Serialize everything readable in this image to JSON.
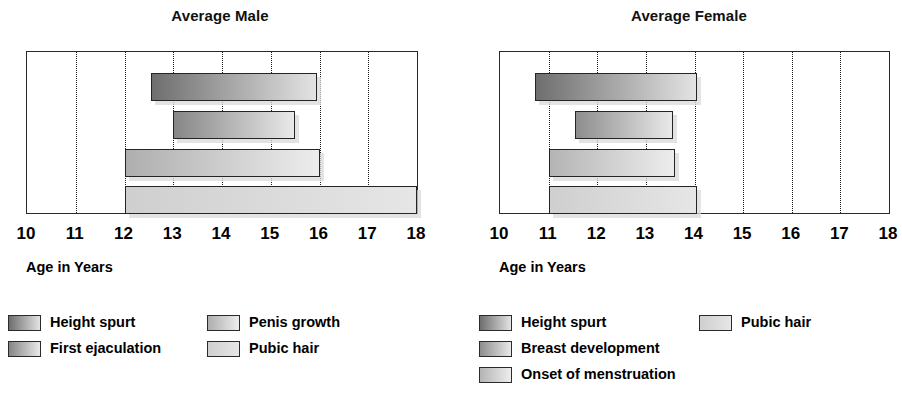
{
  "chart_data": [
    {
      "type": "bar",
      "orientation": "horizontal",
      "title": "Average Male",
      "xlabel": "Age in Years",
      "ylabel": "",
      "xlim": [
        10,
        18
      ],
      "xticks": [
        "10",
        "11",
        "12",
        "13",
        "14",
        "15",
        "16",
        "17",
        "18"
      ],
      "grid": true,
      "legend_position": "bottom",
      "bars": [
        {
          "label": "Height spurt",
          "start": 12.55,
          "end": 15.95,
          "fill_dark": "#6e6e6e",
          "fill_light": "#e3e3e3"
        },
        {
          "label": "First ejaculation",
          "start": 13.0,
          "end": 15.5,
          "fill_dark": "#868686",
          "fill_light": "#e9e9e9"
        },
        {
          "label": "Penis growth",
          "start": 12.0,
          "end": 16.0,
          "fill_dark": "#aeaeae",
          "fill_light": "#ededed"
        },
        {
          "label": "Pubic hair",
          "start": 12.0,
          "end": 18.0,
          "fill_dark": "#cfcfcf",
          "fill_light": "#e6e6e6"
        }
      ],
      "legend": [
        {
          "label": "Height spurt",
          "fill_dark": "#6e6e6e",
          "fill_light": "#e3e3e3"
        },
        {
          "label": "Penis growth",
          "fill_dark": "#aeaeae",
          "fill_light": "#ededed"
        },
        {
          "label": "First ejaculation",
          "fill_dark": "#868686",
          "fill_light": "#e9e9e9"
        },
        {
          "label": "Pubic hair",
          "fill_dark": "#cfcfcf",
          "fill_light": "#e6e6e6"
        }
      ]
    },
    {
      "type": "bar",
      "orientation": "horizontal",
      "title": "Average Female",
      "xlabel": "Age in Years",
      "ylabel": "",
      "xlim": [
        10,
        18
      ],
      "xticks": [
        "10",
        "11",
        "12",
        "13",
        "14",
        "15",
        "16",
        "17",
        "18"
      ],
      "grid": true,
      "legend_position": "bottom",
      "bars": [
        {
          "label": "Height spurt",
          "start": 10.72,
          "end": 14.06,
          "fill_dark": "#6e6e6e",
          "fill_light": "#e3e3e3"
        },
        {
          "label": "Breast development",
          "start": 11.55,
          "end": 13.55,
          "fill_dark": "#8d8d8d",
          "fill_light": "#e9e9e9"
        },
        {
          "label": "Onset of menstruation",
          "start": 11.0,
          "end": 13.6,
          "fill_dark": "#b4b4b4",
          "fill_light": "#ededed"
        },
        {
          "label": "Pubic hair",
          "start": 11.0,
          "end": 14.06,
          "fill_dark": "#cfcfcf",
          "fill_light": "#e6e6e6"
        }
      ],
      "legend": [
        {
          "label": "Height spurt",
          "fill_dark": "#6e6e6e",
          "fill_light": "#e3e3e3"
        },
        {
          "label": "Pubic hair",
          "fill_dark": "#cfcfcf",
          "fill_light": "#e6e6e6"
        },
        {
          "label": "Breast development",
          "fill_dark": "#8d8d8d",
          "fill_light": "#e9e9e9"
        },
        {
          "label": "Onset of menstruation",
          "fill_dark": "#b4b4b4",
          "fill_light": "#ededed"
        }
      ]
    }
  ],
  "male": {
    "title": "Average Male",
    "axis_title": "Age in Years",
    "ticks": [
      "10",
      "11",
      "12",
      "13",
      "14",
      "15",
      "16",
      "17",
      "18"
    ],
    "legend": {
      "item0": "Height spurt",
      "item1": "Penis growth",
      "item2": "First ejaculation",
      "item3": "Pubic hair"
    }
  },
  "female": {
    "title": "Average Female",
    "axis_title": "Age in Years",
    "ticks": [
      "10",
      "11",
      "12",
      "13",
      "14",
      "15",
      "16",
      "17",
      "18"
    ],
    "legend": {
      "item0": "Height spurt",
      "item1": "Pubic hair",
      "item2": "Breast development",
      "item3": "Onset of menstruation"
    }
  }
}
